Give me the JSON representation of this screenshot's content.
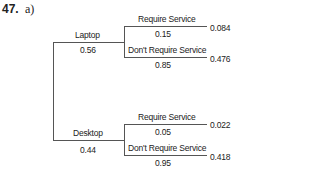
{
  "problem": {
    "number": "47.",
    "part": "a)"
  },
  "tree": {
    "branches": [
      {
        "label": "Laptop",
        "prob": "0.56",
        "children": [
          {
            "label": "Require Service",
            "prob": "0.15",
            "joint": "0.084"
          },
          {
            "label": "Don't Require Service",
            "prob": "0.85",
            "joint": "0.476"
          }
        ]
      },
      {
        "label": "Desktop",
        "prob": "0.44",
        "children": [
          {
            "label": "Require Service",
            "prob": "0.05",
            "joint": "0.022"
          },
          {
            "label": "Don't Require Service",
            "prob": "0.95",
            "joint": "0.418"
          }
        ]
      }
    ]
  }
}
